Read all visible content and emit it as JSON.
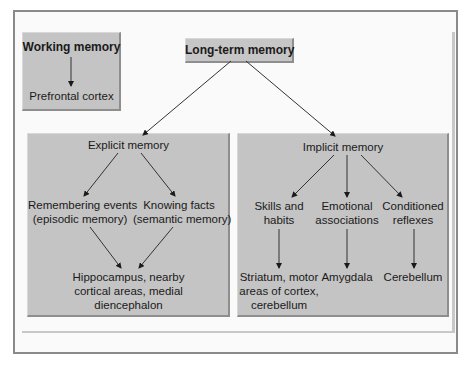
{
  "diagram": {
    "working_memory": {
      "title": "Working memory",
      "region": "Prefrontal cortex"
    },
    "long_term_memory": {
      "title": "Long-term memory"
    },
    "explicit": {
      "title": "Explicit memory",
      "episodic_line1": "Remembering events",
      "episodic_line2": "(episodic memory)",
      "semantic_line1": "Knowing facts",
      "semantic_line2": "(semantic memory)",
      "region_line1": "Hippocampus, nearby",
      "region_line2": "cortical areas, medial",
      "region_line3": "diencephalon"
    },
    "implicit": {
      "title": "Implicit memory",
      "skills_line1": "Skills and",
      "skills_line2": "habits",
      "emotional_line1": "Emotional",
      "emotional_line2": "associations",
      "conditioned_line1": "Conditioned",
      "conditioned_line2": "reflexes",
      "skills_region_line1": "Striatum, motor",
      "skills_region_line2": "areas of cortex,",
      "skills_region_line3": "cerebellum",
      "emotional_region": "Amygdala",
      "conditioned_region": "Cerebellum"
    },
    "colors": {
      "box_fill": "#c4c4c4",
      "frame_border": "#8a8a8a",
      "background": "#fafafa"
    }
  }
}
